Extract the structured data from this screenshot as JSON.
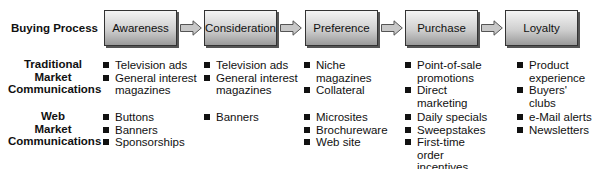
{
  "row_labels": {
    "buying_process": "Buying Process",
    "traditional": [
      "Traditional",
      "Market",
      "Communications"
    ],
    "web": [
      "Web",
      "Market",
      "Communications"
    ]
  },
  "stages": [
    {
      "label": "Awareness"
    },
    {
      "label": "Consideration"
    },
    {
      "label": "Preference"
    },
    {
      "label": "Purchase"
    },
    {
      "label": "Loyalty"
    }
  ],
  "traditional": [
    [
      "Television ads",
      "General interest magazines"
    ],
    [
      "Television ads",
      "General interest magazines"
    ],
    [
      "Niche magazines",
      "Collateral"
    ],
    [
      "Point-of-sale promotions",
      "Direct marketing"
    ],
    [
      "Product experience",
      "Buyers' clubs"
    ]
  ],
  "web": [
    [
      "Buttons",
      "Banners",
      "Sponsorships"
    ],
    [
      "Banners"
    ],
    [
      "Microsites",
      "Brochureware",
      "Web site"
    ],
    [
      "Daily specials",
      "Sweepstakes",
      "First-time order incentives"
    ],
    [
      "e-Mail alerts",
      "Newsletters"
    ]
  ]
}
